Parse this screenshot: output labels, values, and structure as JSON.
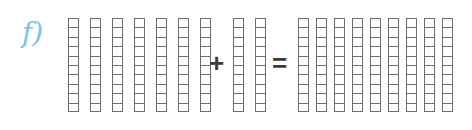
{
  "item": {
    "label": "f)",
    "label_color": "#79c3e8",
    "type": "base-ten-rods-addition"
  },
  "equation": {
    "addend_1": 70,
    "addend_2": 20,
    "sum": 90,
    "plus_symbol": "+",
    "equals_symbol": "=",
    "expression": "70 + 20 = 90"
  },
  "manipulatives": {
    "cells_per_rod": 10,
    "rod_border_color": "#6e6e70",
    "rod_fill_color": "#ffffff",
    "groups": [
      {
        "name": "addend-1",
        "rod_count": 7,
        "value": 70
      },
      {
        "name": "addend-2",
        "rod_count": 2,
        "value": 20
      },
      {
        "name": "sum",
        "rod_count": 9,
        "value": 90
      }
    ]
  }
}
